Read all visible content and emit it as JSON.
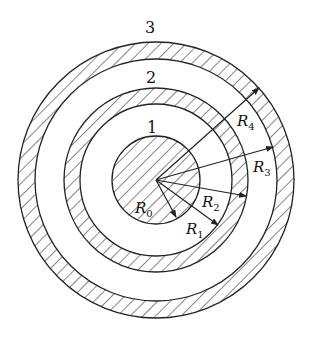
{
  "diagram": {
    "center": {
      "x": 156,
      "y": 180
    },
    "stroke_color": "#222222",
    "background": "#ffffff",
    "regions": [
      {
        "label": "1",
        "inner_radius": 0,
        "outer_radius": 44,
        "hatched": true
      },
      {
        "label": "2",
        "inner_radius": 76,
        "outer_radius": 92,
        "hatched": true
      },
      {
        "label": "3",
        "inner_radius": 121,
        "outer_radius": 138,
        "hatched": true
      }
    ],
    "region_labels": [
      {
        "text": "1",
        "x": 152,
        "y": 133
      },
      {
        "text": "2",
        "x": 151,
        "y": 83
      },
      {
        "text": "3",
        "x": 150,
        "y": 33
      }
    ],
    "radii": [
      {
        "name": "R",
        "sub": "0",
        "length": 44,
        "tip": {
          "x": 176,
          "y": 217
        },
        "label_pos": {
          "x": 135,
          "y": 213
        }
      },
      {
        "name": "R",
        "sub": "1",
        "length": 76,
        "tip": {
          "x": 218,
          "y": 225
        },
        "label_pos": {
          "x": 186,
          "y": 234
        }
      },
      {
        "name": "R",
        "sub": "2",
        "length": 92,
        "tip": {
          "x": 246,
          "y": 196
        },
        "label_pos": {
          "x": 202,
          "y": 207
        }
      },
      {
        "name": "R",
        "sub": "3",
        "length": 121,
        "tip": {
          "x": 273,
          "y": 147
        },
        "label_pos": {
          "x": 253,
          "y": 172
        }
      },
      {
        "name": "R",
        "sub": "4",
        "length": 138,
        "tip": {
          "x": 259,
          "y": 88
        },
        "label_pos": {
          "x": 237,
          "y": 126
        }
      }
    ]
  }
}
